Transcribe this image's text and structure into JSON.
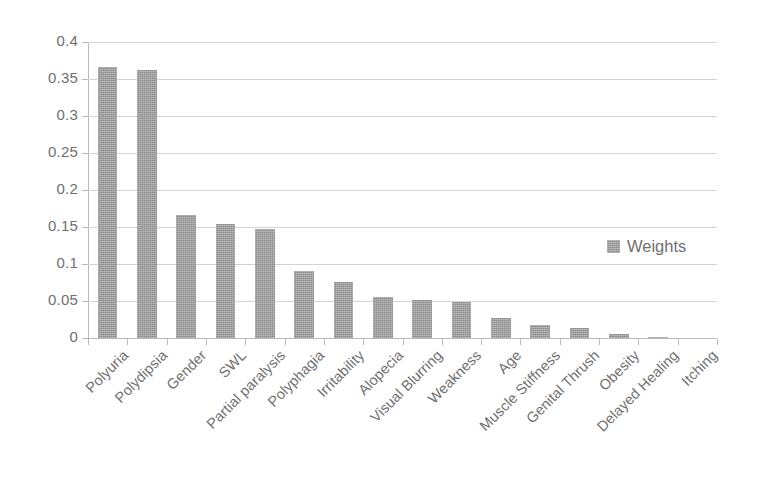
{
  "chart_data": {
    "type": "bar",
    "title": "",
    "subtitle": "",
    "xlabel": "",
    "ylabel": "",
    "ylim": [
      0,
      0.4
    ],
    "ytick_labels": [
      "0.4",
      "0.35",
      "0.3",
      "0.25",
      "0.2",
      "0.15",
      "0.1",
      "0.05",
      "0"
    ],
    "ytick_values": [
      0.4,
      0.35,
      0.3,
      0.25,
      0.2,
      0.15,
      0.1,
      0.05,
      0
    ],
    "grid": true,
    "legend": {
      "position": "center-right",
      "entries": [
        {
          "label": "Weights",
          "color": "#9c9c9c",
          "marker": "square-swatch"
        }
      ]
    },
    "series": [
      {
        "name": "Weights",
        "color": "#9c9c9c",
        "values": [
          0.366,
          0.362,
          0.166,
          0.154,
          0.147,
          0.091,
          0.076,
          0.055,
          0.051,
          0.048,
          0.027,
          0.018,
          0.014,
          0.006,
          0.001,
          0.0
        ]
      }
    ],
    "categories": [
      "Polyuria",
      "Polydipsia",
      "Gender",
      "SWL",
      "Partial paralysis",
      "Polyphagia",
      "Irritability",
      "Alopecia",
      "Visual Blurring",
      "Weakness",
      "Age",
      "Muscle Stiffness",
      "Genital Thrush",
      "Obesity",
      "Delayed Healing",
      "Itching"
    ]
  },
  "style": {
    "background": "#ffffff",
    "axis_color": "#b9b9b9",
    "grid_color": "#d4d4d4",
    "text_color": "#6f6f6f",
    "bar_color": "#9c9c9c"
  }
}
